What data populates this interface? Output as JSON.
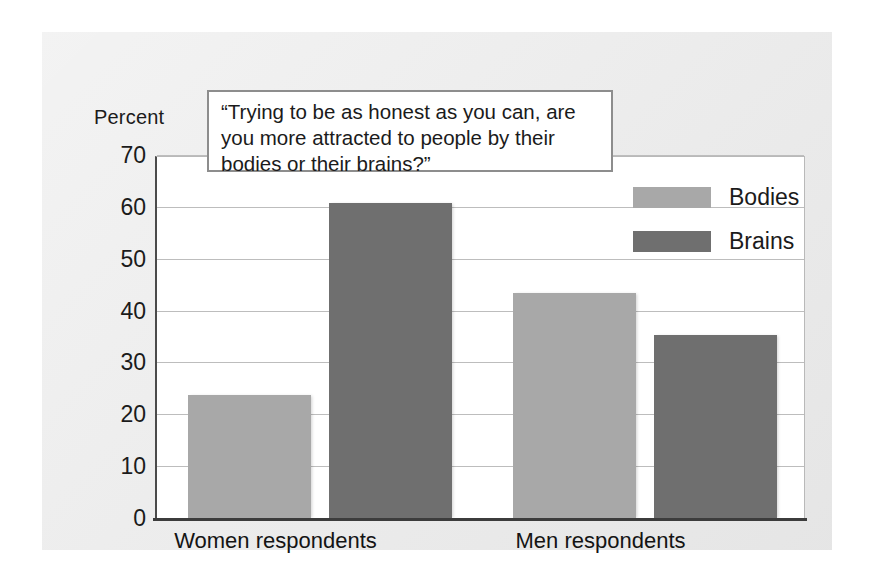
{
  "figure": {
    "question_text": "“Trying to be as honest as you can, are you more attracted to people by their bodies or their brains?”",
    "y_axis_title": "Percent"
  },
  "legend": {
    "items": [
      {
        "label": "Bodies",
        "color": "#a8a8a8"
      },
      {
        "label": "Brains",
        "color": "#6f6f6f"
      }
    ]
  },
  "chart_data": {
    "type": "bar",
    "title": "“Trying to be as honest as you can, are you more attracted to people by their bodies or their brains?”",
    "categories": [
      "Women respondents",
      "Men respondents"
    ],
    "series": [
      {
        "name": "Bodies",
        "values": [
          24,
          43.5
        ],
        "color": "#a8a8a8"
      },
      {
        "name": "Brains",
        "values": [
          61,
          35.5
        ],
        "color": "#6f6f6f"
      }
    ],
    "xlabel": "",
    "ylabel": "Percent",
    "ylim": [
      0,
      70
    ],
    "yticks": [
      0,
      10,
      20,
      30,
      40,
      50,
      60,
      70
    ],
    "ytick_labels": [
      "0",
      "10",
      "20",
      "30",
      "40",
      "50",
      "60",
      "70"
    ],
    "grid": true,
    "legend_position": "upper right"
  }
}
